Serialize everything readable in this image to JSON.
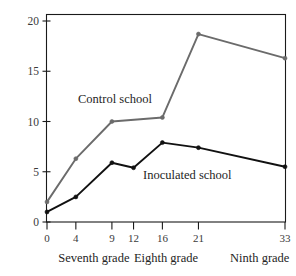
{
  "chart_data": {
    "type": "line",
    "title": "",
    "subtitle": "",
    "xlabel": "",
    "ylabel": "Smoking (percent)",
    "x": [
      0,
      4,
      9,
      12,
      16,
      21,
      33
    ],
    "xlim": [
      0,
      33
    ],
    "ylim": [
      0,
      20
    ],
    "xticks": [
      "0",
      "4",
      "9",
      "12",
      "16",
      "21",
      "33"
    ],
    "yticks": [
      "0",
      "5",
      "10",
      "15",
      "20"
    ],
    "grid": false,
    "legend_position": "inline-annotation",
    "series": [
      {
        "name": "Control school",
        "color": "#6b6b6b",
        "x": [
          0,
          4,
          9,
          16,
          21,
          33
        ],
        "values": [
          2.0,
          6.3,
          10.0,
          10.4,
          18.7,
          16.3
        ]
      },
      {
        "name": "Inoculated school",
        "color": "#111111",
        "x": [
          0,
          4,
          9,
          12,
          16,
          21,
          33
        ],
        "values": [
          1.0,
          2.5,
          5.9,
          5.4,
          7.9,
          7.4,
          5.5
        ]
      }
    ],
    "annotations": [
      {
        "text": "Control school",
        "x_px": 78,
        "y_px": 103
      },
      {
        "text": "Inoculated school",
        "x_px": 143,
        "y_px": 179
      }
    ],
    "group_labels": [
      {
        "text": "Seventh grade",
        "center_x": 6.5
      },
      {
        "text": "Eighth grade",
        "center_x": 16.5
      },
      {
        "text": "Ninth grade",
        "center_x": 29.5
      }
    ]
  },
  "axis": {
    "y_label": "Smoking (percent)",
    "y_ticks": [
      "20",
      "15",
      "10",
      "5",
      "0"
    ],
    "x_ticks": [
      "0",
      "4",
      "9",
      "12",
      "16",
      "21",
      "33"
    ]
  },
  "labels": {
    "control": "Control school",
    "inoculated": "Inoculated school",
    "seventh": "Seventh grade",
    "eighth": "Eighth grade",
    "ninth": "Ninth grade"
  },
  "colors": {
    "control_line": "#6b6b6b",
    "inoculated_line": "#111111",
    "frame": "#1a1a1a",
    "background": "#ffffff"
  }
}
